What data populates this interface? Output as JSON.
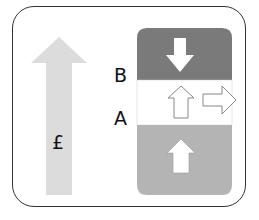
{
  "diagram": {
    "left_arrow": {
      "symbol": "£",
      "color": "#dcdcdc"
    },
    "labels": {
      "b": "B",
      "a": "A"
    },
    "column": {
      "top_color": "#7a7a7a",
      "middle_color": "#ffffff",
      "bottom_color": "#b4b4b4"
    }
  }
}
